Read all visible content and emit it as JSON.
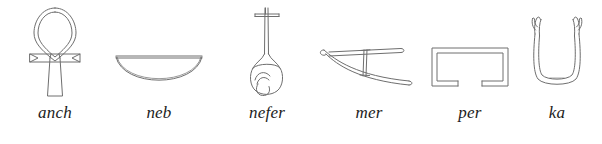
{
  "figure": {
    "kind": "egyptian-hieroglyph-chart",
    "background_color": "#ffffff",
    "stroke_color": "#6e6e6e",
    "label_color": "#1c1c1c",
    "glyph_count": 6
  },
  "glyphs": [
    {
      "label": "anch",
      "icon_name": "ankh-glyph",
      "meaning_shape": "looped cross"
    },
    {
      "label": "neb",
      "icon_name": "basket-glyph",
      "meaning_shape": "basket / bowl"
    },
    {
      "label": "nefer",
      "icon_name": "heart-and-windpipe-glyph",
      "meaning_shape": "heart with windpipe"
    },
    {
      "label": "mer",
      "icon_name": "hoe-glyph",
      "meaning_shape": "hoe"
    },
    {
      "label": "per",
      "icon_name": "house-plan-glyph",
      "meaning_shape": "house ground plan"
    },
    {
      "label": "ka",
      "icon_name": "upraised-arms-glyph",
      "meaning_shape": "two upraised arms"
    }
  ]
}
